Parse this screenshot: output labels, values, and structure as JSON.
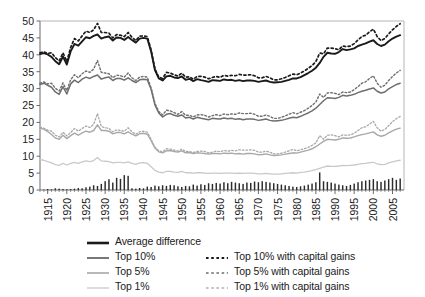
{
  "chart_data": {
    "type": "line",
    "title": "",
    "xlabel": "",
    "ylabel": "",
    "xlim": [
      1913,
      2008
    ],
    "ylim": [
      0,
      50
    ],
    "ytick_step": 5,
    "yticks": [
      0,
      5,
      10,
      15,
      20,
      25,
      30,
      35,
      40,
      45,
      50
    ],
    "xticks": [
      1915,
      1920,
      1925,
      1930,
      1935,
      1940,
      1945,
      1950,
      1955,
      1960,
      1965,
      1970,
      1975,
      1980,
      1985,
      1990,
      1995,
      2000,
      2005
    ],
    "grid": false,
    "legend_position": "below",
    "x": [
      1913,
      1914,
      1915,
      1916,
      1917,
      1918,
      1919,
      1920,
      1921,
      1922,
      1923,
      1924,
      1925,
      1926,
      1927,
      1928,
      1929,
      1930,
      1931,
      1932,
      1933,
      1934,
      1935,
      1936,
      1937,
      1938,
      1939,
      1940,
      1941,
      1942,
      1943,
      1944,
      1945,
      1946,
      1947,
      1948,
      1949,
      1950,
      1951,
      1952,
      1953,
      1954,
      1955,
      1956,
      1957,
      1958,
      1959,
      1960,
      1961,
      1962,
      1963,
      1964,
      1965,
      1966,
      1967,
      1968,
      1969,
      1970,
      1971,
      1972,
      1973,
      1974,
      1975,
      1976,
      1977,
      1978,
      1979,
      1980,
      1981,
      1982,
      1983,
      1984,
      1985,
      1986,
      1987,
      1988,
      1989,
      1990,
      1991,
      1992,
      1993,
      1994,
      1995,
      1996,
      1997,
      1998,
      1999,
      2000,
      2001,
      2002,
      2003,
      2004,
      2005,
      2006,
      2007
    ],
    "series": [
      {
        "name": "Average difference",
        "style": "solid",
        "color": "#1a1a1a",
        "width": 1.9,
        "values": [
          40.2,
          40.5,
          40.1,
          39.4,
          38.1,
          37.2,
          39.5,
          37.1,
          41.0,
          43.2,
          42.7,
          44.0,
          45.2,
          44.9,
          45.6,
          46.0,
          44.8,
          45.2,
          45.4,
          44.2,
          45.1,
          45.0,
          44.4,
          45.3,
          44.4,
          43.6,
          44.8,
          45.0,
          44.8,
          41.0,
          35.5,
          33.0,
          32.4,
          33.6,
          33.8,
          33.3,
          33.1,
          33.6,
          32.6,
          32.9,
          32.2,
          32.8,
          32.5,
          32.3,
          32.0,
          32.5,
          32.4,
          32.3,
          32.7,
          32.5,
          32.6,
          32.3,
          32.5,
          32.2,
          32.4,
          32.4,
          32.3,
          32.0,
          32.2,
          32.4,
          32.0,
          31.8,
          31.9,
          32.0,
          32.3,
          32.6,
          33.0,
          33.0,
          33.4,
          34.0,
          34.6,
          35.3,
          36.2,
          37.6,
          39.4,
          40.6,
          40.4,
          40.3,
          40.8,
          41.7,
          41.4,
          41.6,
          41.9,
          42.6,
          43.0,
          43.4,
          43.9,
          44.3,
          43.2,
          42.6,
          43.0,
          44.0,
          44.8,
          45.4,
          45.8
        ]
      },
      {
        "name": "Top 10% with capital gains",
        "style": "dotted",
        "color": "#1a1a1a",
        "width": 1.7,
        "values": [
          40.6,
          40.9,
          40.4,
          40.6,
          39.2,
          38.2,
          40.6,
          38.0,
          42.2,
          44.8,
          44.1,
          45.6,
          47.0,
          46.6,
          47.4,
          49.3,
          46.6,
          46.6,
          46.4,
          45.0,
          46.0,
          45.8,
          45.4,
          46.6,
          45.2,
          44.2,
          45.5,
          45.6,
          45.4,
          41.4,
          35.8,
          33.4,
          33.0,
          34.8,
          34.6,
          34.1,
          33.7,
          34.6,
          33.4,
          33.5,
          32.8,
          33.6,
          33.6,
          33.4,
          32.9,
          33.3,
          33.6,
          33.3,
          33.9,
          33.7,
          33.9,
          33.8,
          34.2,
          34.0,
          34.0,
          34.1,
          33.8,
          33.2,
          33.2,
          33.6,
          33.2,
          32.6,
          32.6,
          32.9,
          33.3,
          33.8,
          34.3,
          34.1,
          34.6,
          35.2,
          36.0,
          36.8,
          38.0,
          40.5,
          40.3,
          42.0,
          42.0,
          41.8,
          41.5,
          42.6,
          42.4,
          42.6,
          43.3,
          44.4,
          45.4,
          45.8,
          46.8,
          47.6,
          45.4,
          44.2,
          44.8,
          46.2,
          47.4,
          48.4,
          49.2
        ]
      },
      {
        "name": "Top 10%",
        "style": "solid",
        "color": "#6e6e6e",
        "width": 1.5,
        "values": [
          31.2,
          31.6,
          31.0,
          30.4,
          29.0,
          28.3,
          30.6,
          28.4,
          31.4,
          32.5,
          31.8,
          32.8,
          33.4,
          33.0,
          33.6,
          34.0,
          32.8,
          33.2,
          33.4,
          32.4,
          33.0,
          33.0,
          32.5,
          33.2,
          32.4,
          31.8,
          32.6,
          32.8,
          32.6,
          29.8,
          25.2,
          22.8,
          21.6,
          22.4,
          22.6,
          22.1,
          21.8,
          22.2,
          21.3,
          21.5,
          21.0,
          21.5,
          21.2,
          21.0,
          20.8,
          21.2,
          21.1,
          21.0,
          21.3,
          21.1,
          21.2,
          20.9,
          21.1,
          20.8,
          21.0,
          21.0,
          20.9,
          20.6,
          20.8,
          21.0,
          20.6,
          20.4,
          20.5,
          20.6,
          20.9,
          21.2,
          21.5,
          21.4,
          21.8,
          22.3,
          22.8,
          23.4,
          24.2,
          25.3,
          26.4,
          27.3,
          27.2,
          27.1,
          27.4,
          28.0,
          27.8,
          28.0,
          28.3,
          28.8,
          29.2,
          29.5,
          29.9,
          30.2,
          29.2,
          28.7,
          29.0,
          29.9,
          30.6,
          31.2,
          31.6
        ]
      },
      {
        "name": "Top 5% with capital gains",
        "style": "dotted",
        "color": "#6e6e6e",
        "width": 1.4,
        "values": [
          31.6,
          32.0,
          31.4,
          31.6,
          30.1,
          29.3,
          31.7,
          29.4,
          32.6,
          34.1,
          33.2,
          34.4,
          35.2,
          34.8,
          35.8,
          38.3,
          34.8,
          34.6,
          34.4,
          33.2,
          34.0,
          33.8,
          33.4,
          34.6,
          33.2,
          32.4,
          33.4,
          33.6,
          33.4,
          30.2,
          25.6,
          23.2,
          22.2,
          23.6,
          23.4,
          22.9,
          22.4,
          23.2,
          22.1,
          22.1,
          21.6,
          22.2,
          22.3,
          22.1,
          21.6,
          22.0,
          22.3,
          22.0,
          22.5,
          22.3,
          22.5,
          22.4,
          22.8,
          22.6,
          22.6,
          22.7,
          22.4,
          21.8,
          21.8,
          22.2,
          21.8,
          21.2,
          21.2,
          21.5,
          21.9,
          22.4,
          22.9,
          22.5,
          23.0,
          23.5,
          24.2,
          25.0,
          26.0,
          28.4,
          27.4,
          28.7,
          28.8,
          28.6,
          28.2,
          29.0,
          28.8,
          29.0,
          29.7,
          30.6,
          31.6,
          32.0,
          33.0,
          33.8,
          31.6,
          30.4,
          31.0,
          32.4,
          33.6,
          34.6,
          35.4
        ]
      },
      {
        "name": "Top 5%",
        "style": "solid",
        "color": "#a8a8a8",
        "width": 1.4,
        "values": [
          18.3,
          18.0,
          17.3,
          16.4,
          15.4,
          15.0,
          16.2,
          15.2,
          16.1,
          16.8,
          16.2,
          16.9,
          17.4,
          17.1,
          17.6,
          19.3,
          17.6,
          17.6,
          17.4,
          16.6,
          17.0,
          17.0,
          16.6,
          17.2,
          16.5,
          16.0,
          16.6,
          16.8,
          16.5,
          14.6,
          12.4,
          11.3,
          11.0,
          11.6,
          11.7,
          11.4,
          11.2,
          11.6,
          11.0,
          11.1,
          10.8,
          11.0,
          10.9,
          10.8,
          10.6,
          10.8,
          10.8,
          10.7,
          10.9,
          10.8,
          10.9,
          10.7,
          10.8,
          10.6,
          10.8,
          10.8,
          10.7,
          10.4,
          10.5,
          10.7,
          10.4,
          10.2,
          10.3,
          10.4,
          10.6,
          10.8,
          11.0,
          10.9,
          11.2,
          11.5,
          11.8,
          12.2,
          12.8,
          13.6,
          14.4,
          15.0,
          14.9,
          14.8,
          15.0,
          15.4,
          15.3,
          15.4,
          15.7,
          16.1,
          16.4,
          16.6,
          16.9,
          17.2,
          16.3,
          15.9,
          16.2,
          16.9,
          17.5,
          18.0,
          18.3
        ]
      },
      {
        "name": "Top 1% with capital gains",
        "style": "dotted",
        "color": "#a8a8a8",
        "width": 1.3,
        "values": [
          18.6,
          18.3,
          17.7,
          17.4,
          16.2,
          15.7,
          17.1,
          16.0,
          17.0,
          18.2,
          17.4,
          18.2,
          18.9,
          18.5,
          19.4,
          22.6,
          18.8,
          18.4,
          18.2,
          17.2,
          17.8,
          17.6,
          17.4,
          18.4,
          17.2,
          16.5,
          17.2,
          17.4,
          17.1,
          15.0,
          12.7,
          11.6,
          11.3,
          12.2,
          12.1,
          11.8,
          11.5,
          12.1,
          11.4,
          11.4,
          11.1,
          11.4,
          11.5,
          11.4,
          11.0,
          11.2,
          11.5,
          11.3,
          11.7,
          11.5,
          11.7,
          11.6,
          11.9,
          11.8,
          11.8,
          11.9,
          11.7,
          11.2,
          11.2,
          11.5,
          11.2,
          10.7,
          10.7,
          10.9,
          11.2,
          11.6,
          12.0,
          11.6,
          11.9,
          12.2,
          12.6,
          13.2,
          13.9,
          16.1,
          15.0,
          16.2,
          16.3,
          16.1,
          15.7,
          16.3,
          16.2,
          16.3,
          16.8,
          17.6,
          18.4,
          18.7,
          19.5,
          20.3,
          18.4,
          17.4,
          17.9,
          19.1,
          20.2,
          21.1,
          21.8
        ]
      },
      {
        "name": "Top 1%",
        "style": "solid",
        "color": "#c9c9c9",
        "width": 1.3,
        "values": [
          9.0,
          8.8,
          8.4,
          8.0,
          7.5,
          7.3,
          7.9,
          7.4,
          7.9,
          8.2,
          7.9,
          8.3,
          8.6,
          8.4,
          8.7,
          9.6,
          8.6,
          8.5,
          8.4,
          8.0,
          8.2,
          8.2,
          8.0,
          8.3,
          7.9,
          7.6,
          8.0,
          8.1,
          7.9,
          6.9,
          5.8,
          5.3,
          5.1,
          5.5,
          5.5,
          5.3,
          5.2,
          5.5,
          5.1,
          5.1,
          5.0,
          5.1,
          5.1,
          5.0,
          4.9,
          5.0,
          5.0,
          4.9,
          5.0,
          5.0,
          5.0,
          4.9,
          5.0,
          4.9,
          5.0,
          5.0,
          4.9,
          4.8,
          4.8,
          4.9,
          4.8,
          4.7,
          4.7,
          4.8,
          4.9,
          5.0,
          5.1,
          5.0,
          5.2,
          5.3,
          5.5,
          5.7,
          6.0,
          6.4,
          6.8,
          7.1,
          7.0,
          7.0,
          7.1,
          7.3,
          7.2,
          7.3,
          7.4,
          7.6,
          7.8,
          7.9,
          8.1,
          8.2,
          7.7,
          7.5,
          7.6,
          8.0,
          8.3,
          8.6,
          8.8
        ]
      }
    ],
    "bar_series": {
      "name": "bars",
      "color": "#2b2b2b",
      "values": [
        0.0,
        0.1,
        0.3,
        0.2,
        0.5,
        0.4,
        0.3,
        0.2,
        0.3,
        0.4,
        0.6,
        0.5,
        0.8,
        1.0,
        1.4,
        1.2,
        1.8,
        2.6,
        3.2,
        2.2,
        3.6,
        3.3,
        4.4,
        4.2,
        0.5,
        0.4,
        0.6,
        0.5,
        1.0,
        0.9,
        1.3,
        1.1,
        1.4,
        1.2,
        1.5,
        1.4,
        1.1,
        0.9,
        1.2,
        1.1,
        1.6,
        1.3,
        1.7,
        1.5,
        2.0,
        1.8,
        2.1,
        1.9,
        2.3,
        2.0,
        2.4,
        2.2,
        2.0,
        1.8,
        2.2,
        2.1,
        2.5,
        2.3,
        2.6,
        2.4,
        2.2,
        2.0,
        1.8,
        1.6,
        1.4,
        1.2,
        1.0,
        0.9,
        1.1,
        1.3,
        1.6,
        1.9,
        2.3,
        5.2,
        2.6,
        2.4,
        2.2,
        1.9,
        1.6,
        1.4,
        1.2,
        1.5,
        1.9,
        2.3,
        2.6,
        2.8,
        3.0,
        3.2,
        2.6,
        2.4,
        2.8,
        3.2,
        3.6,
        3.0,
        3.4
      ]
    }
  },
  "legend": {
    "left_column": [
      {
        "label": "Average difference",
        "style": "solid",
        "color": "#1a1a1a",
        "width": 2.6,
        "name": "legend-average-difference"
      },
      {
        "label": "Top 10%",
        "style": "solid",
        "color": "#555555",
        "width": 1.6,
        "name": "legend-top-10"
      },
      {
        "label": "Top 5%",
        "style": "solid",
        "color": "#9a9a9a",
        "width": 1.4,
        "name": "legend-top-5"
      },
      {
        "label": "Top 1%",
        "style": "solid",
        "color": "#c9c9c9",
        "width": 1.3,
        "name": "legend-top-1"
      }
    ],
    "right_column": [
      {
        "label": "Top 10% with capital gains",
        "style": "dotted",
        "color": "#1a1a1a",
        "width": 1.8,
        "name": "legend-top-10-cg"
      },
      {
        "label": "Top 5% with capital gains",
        "style": "dotted",
        "color": "#6e6e6e",
        "width": 1.5,
        "name": "legend-top-5-cg"
      },
      {
        "label": "Top 1% with capital gains",
        "style": "dotted",
        "color": "#b0b0b0",
        "width": 1.4,
        "name": "legend-top-1-cg"
      }
    ]
  }
}
